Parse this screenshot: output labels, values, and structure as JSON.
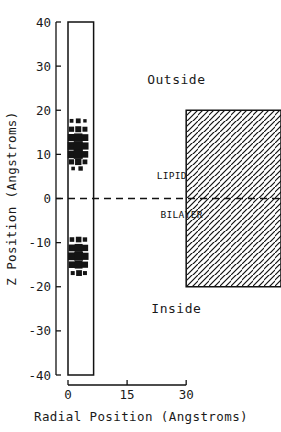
{
  "figure": {
    "background_color": "#ffffff",
    "ink_color": "#111111"
  },
  "axes": {
    "y": {
      "title": "Z Position (Angstroms)",
      "ticks": [
        -40,
        -30,
        -20,
        -10,
        0,
        10,
        20,
        30,
        40
      ],
      "tick_labels": [
        "-40",
        "-30",
        "-20",
        "-10",
        "0",
        "10",
        "20",
        "30",
        "40"
      ],
      "min": -40,
      "max": 40
    },
    "x": {
      "title": "Radial Position (Angstroms)",
      "ticks": [
        0,
        15,
        30
      ],
      "tick_labels": [
        "0",
        "15",
        "30"
      ],
      "min": 0,
      "max": 33
    }
  },
  "annotations": {
    "outside_label": "Outside",
    "inside_label": "Inside",
    "lipid_label": "LIPID",
    "bilayer_label": "BILAYER"
  },
  "chart_data": {
    "type": "scatter",
    "title": "",
    "xlabel": "Radial Position (Angstroms)",
    "ylabel": "Z Position (Angstroms)",
    "xlim": [
      0,
      33
    ],
    "ylim": [
      -40,
      40
    ],
    "grid": false,
    "legend": null,
    "annotations": [
      {
        "text": "Outside",
        "x": 27.5,
        "y": 26,
        "role": "region-label"
      },
      {
        "text": "Inside",
        "x": 27.5,
        "y": -26,
        "role": "region-label"
      },
      {
        "text": "LIPID",
        "x": 22.5,
        "y": 4.5,
        "role": "region-interior-label"
      },
      {
        "text": "BILAYER",
        "x": 23.5,
        "y": -4.5,
        "role": "region-interior-label"
      }
    ],
    "shapes": [
      {
        "name": "channel-pore",
        "type": "rect",
        "x0": 0.0,
        "x1": 6.5,
        "y0": -40,
        "y1": 40,
        "fill": "none",
        "stroke": "#111111"
      },
      {
        "name": "lipid-bilayer",
        "type": "rect",
        "x0": 30.0,
        "x1": 33.0,
        "y0": -20,
        "y1": 20,
        "fill": "diagonal-hatch",
        "stroke": "#111111"
      },
      {
        "name": "membrane-midplane",
        "type": "hline",
        "y": 0,
        "x0": 0.0,
        "x1": 33.0,
        "style": "dashed"
      }
    ],
    "series": [
      {
        "name": "upper-density-cluster",
        "marker": "square",
        "comment": "marker size encodes occupancy/density",
        "points": [
          {
            "x": 0.9,
            "y": 17.6,
            "size": 1.9
          },
          {
            "x": 2.6,
            "y": 17.6,
            "size": 2.4
          },
          {
            "x": 4.3,
            "y": 17.6,
            "size": 1.7
          },
          {
            "x": 0.9,
            "y": 15.7,
            "size": 2.6
          },
          {
            "x": 2.6,
            "y": 15.7,
            "size": 3.0
          },
          {
            "x": 4.3,
            "y": 15.7,
            "size": 2.5
          },
          {
            "x": 0.9,
            "y": 13.8,
            "size": 3.6
          },
          {
            "x": 2.6,
            "y": 13.8,
            "size": 4.2
          },
          {
            "x": 4.3,
            "y": 13.8,
            "size": 3.4
          },
          {
            "x": 0.9,
            "y": 11.9,
            "size": 3.9
          },
          {
            "x": 2.6,
            "y": 11.9,
            "size": 4.6
          },
          {
            "x": 4.3,
            "y": 11.9,
            "size": 3.6
          },
          {
            "x": 0.9,
            "y": 10.0,
            "size": 3.8
          },
          {
            "x": 2.6,
            "y": 10.0,
            "size": 4.5
          },
          {
            "x": 4.3,
            "y": 10.0,
            "size": 3.3
          },
          {
            "x": 0.9,
            "y": 8.3,
            "size": 2.6
          },
          {
            "x": 2.6,
            "y": 8.3,
            "size": 3.2
          },
          {
            "x": 4.3,
            "y": 8.3,
            "size": 2.4
          },
          {
            "x": 1.3,
            "y": 6.8,
            "size": 1.8
          },
          {
            "x": 3.2,
            "y": 6.8,
            "size": 2.2
          }
        ]
      },
      {
        "name": "lower-density-cluster",
        "marker": "square",
        "comment": "marker size encodes occupancy/density",
        "points": [
          {
            "x": 1.0,
            "y": -9.3,
            "size": 2.3
          },
          {
            "x": 2.7,
            "y": -9.3,
            "size": 2.8
          },
          {
            "x": 4.3,
            "y": -9.3,
            "size": 2.2
          },
          {
            "x": 1.0,
            "y": -11.2,
            "size": 3.4
          },
          {
            "x": 2.7,
            "y": -11.2,
            "size": 4.0
          },
          {
            "x": 4.3,
            "y": -11.2,
            "size": 3.2
          },
          {
            "x": 1.0,
            "y": -13.1,
            "size": 3.9
          },
          {
            "x": 2.7,
            "y": -13.1,
            "size": 4.4
          },
          {
            "x": 4.3,
            "y": -13.1,
            "size": 3.6
          },
          {
            "x": 1.0,
            "y": -15.0,
            "size": 3.3
          },
          {
            "x": 2.7,
            "y": -15.0,
            "size": 3.9
          },
          {
            "x": 4.3,
            "y": -15.0,
            "size": 3.1
          },
          {
            "x": 1.2,
            "y": -16.9,
            "size": 2.0
          },
          {
            "x": 2.8,
            "y": -16.9,
            "size": 2.9
          },
          {
            "x": 4.3,
            "y": -16.9,
            "size": 2.0
          }
        ]
      }
    ]
  }
}
